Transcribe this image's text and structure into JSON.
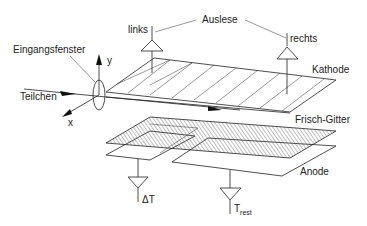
{
  "diagram": {
    "type": "detector-schematic",
    "labels": {
      "auslese": "Auslese",
      "links": "links",
      "rechts": "rechts",
      "eingangsfenster": "Eingangsfenster",
      "kathode": "Kathode",
      "teilchen": "Teilchen",
      "frisch_gitter": "Frisch-Gitter",
      "anode": "Anode",
      "delta_t": "ΔT",
      "t_rest_main": "T",
      "t_rest_sub": "rest",
      "axis_x": "x",
      "axis_y": "y"
    },
    "colors": {
      "line": "#222222",
      "background": "#ffffff"
    }
  }
}
